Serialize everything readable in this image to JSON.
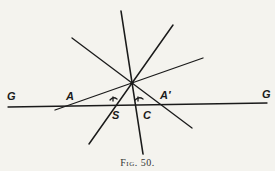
{
  "figure": {
    "caption": "Fig. 50.",
    "stroke_color": "#1a1a1a",
    "background": "#f4f3ee",
    "labels": {
      "G_left": "G",
      "A": "A",
      "S": "S",
      "C": "C",
      "A_prime": "A′",
      "G_right": "G"
    },
    "lines": [
      {
        "name": "ground-line-GG",
        "x1": 8,
        "y1": 107,
        "x2": 267,
        "y2": 103
      },
      {
        "name": "near-vertical-line",
        "x1": 121,
        "y1": 11,
        "x2": 143,
        "y2": 154
      },
      {
        "name": "steep-line-through-S",
        "x1": 173,
        "y1": 25,
        "x2": 89,
        "y2": 144
      },
      {
        "name": "line-through-A",
        "x1": 203,
        "y1": 58,
        "x2": 55,
        "y2": 110
      },
      {
        "name": "line-through-A-prime",
        "x1": 72,
        "y1": 38,
        "x2": 192,
        "y2": 128
      }
    ],
    "intersection_point": {
      "x": 132,
      "y": 83
    }
  }
}
